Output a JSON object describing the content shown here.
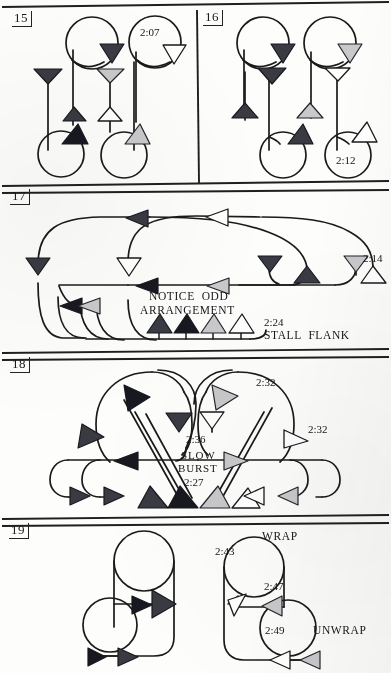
{
  "page": {
    "width": 391,
    "height": 673,
    "ink_color": "#1a1a1a",
    "paper_color": "#fdfdfb"
  },
  "fills": {
    "dark": "#3a3a42",
    "black": "#181820",
    "medium": "#6f6f78",
    "light": "#c9c9cc",
    "white": "#ffffff"
  },
  "panels": [
    {
      "number": "15",
      "labels": [
        {
          "text": "2:07",
          "kind": "time"
        }
      ]
    },
    {
      "number": "16",
      "labels": [
        {
          "text": "2:12",
          "kind": "time"
        }
      ]
    },
    {
      "number": "17",
      "labels": [
        {
          "text": "2:14",
          "kind": "time"
        },
        {
          "text": "NOTICE  ODD",
          "kind": "caps"
        },
        {
          "text": "ARRANGEMENT",
          "kind": "caps"
        },
        {
          "text": "2:24",
          "kind": "time"
        },
        {
          "text": "STALL  FLANK",
          "kind": "caps"
        }
      ]
    },
    {
      "number": "18",
      "labels": [
        {
          "text": "2:32",
          "kind": "time"
        },
        {
          "text": "2:32",
          "kind": "time"
        },
        {
          "text": "2:36",
          "kind": "time"
        },
        {
          "text": "SLOW",
          "kind": "caps2"
        },
        {
          "text": "BURST",
          "kind": "caps2"
        },
        {
          "text": "2:27",
          "kind": "time"
        }
      ]
    },
    {
      "number": "19",
      "labels": [
        {
          "text": "WRAP",
          "kind": "caps"
        },
        {
          "text": "2:43",
          "kind": "time"
        },
        {
          "text": "2:47",
          "kind": "time"
        },
        {
          "text": "2:49",
          "kind": "time"
        },
        {
          "text": "UNWRAP",
          "kind": "caps"
        }
      ]
    }
  ],
  "panel15": {
    "number": "15",
    "time_2_07": "2:07"
  },
  "panel16": {
    "number": "16",
    "time_2_12": "2:12"
  },
  "panel17": {
    "number": "17",
    "time_2_14": "2:14",
    "notice_odd": "NOTICE  ODD",
    "arrangement": "ARRANGEMENT",
    "time_2_24": "2:24",
    "stall_flank": "STALL  FLANK"
  },
  "panel18": {
    "number": "18",
    "time_2_32_a": "2:32",
    "time_2_32_b": "2:32",
    "time_2_36": "2:36",
    "slow": "SLOW",
    "burst": "BURST",
    "time_2_27": "2:27"
  },
  "panel19": {
    "number": "19",
    "wrap": "WRAP",
    "time_2_43": "2:43",
    "time_2_47": "2:47",
    "time_2_49": "2:49",
    "unwrap": "UNWRAP"
  }
}
